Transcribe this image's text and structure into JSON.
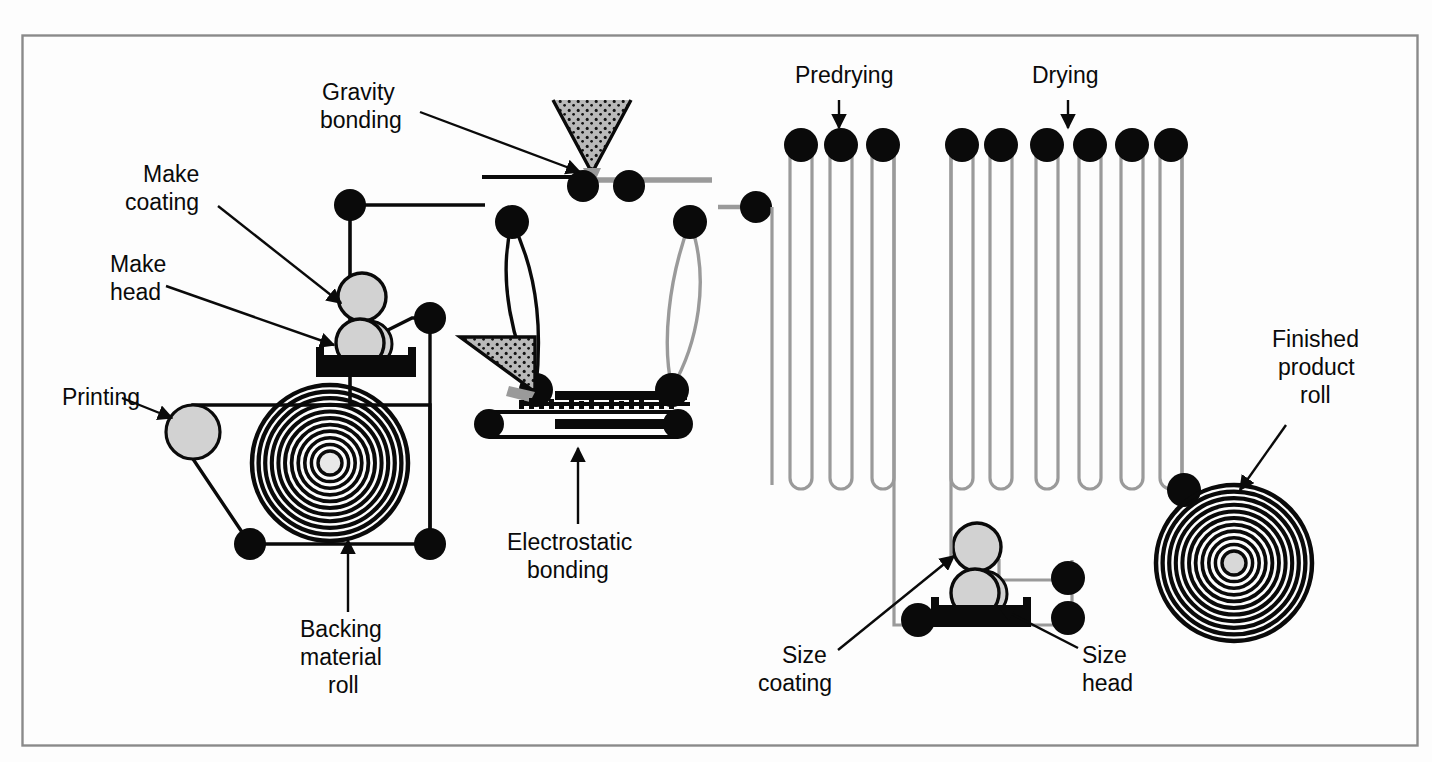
{
  "figure": {
    "background_color": "#fdfdfd",
    "border_color": "#8a8a8a",
    "ink_color": "#0a0a0a",
    "web_gray": "#9a9a9a",
    "roller_fill": "#d2d2d2",
    "grit_fill": "#b9b9b9"
  },
  "labels": {
    "printing": {
      "lines": [
        "Printing"
      ],
      "x": 62,
      "y": 405
    },
    "make_head": {
      "lines": [
        "Make",
        "head"
      ],
      "x": 110,
      "y": 272
    },
    "make_coating": {
      "lines": [
        "Make",
        "coating"
      ],
      "x": 143,
      "y": 182
    },
    "gravity_bonding": {
      "lines": [
        "Gravity",
        "bonding"
      ],
      "x": 322,
      "y": 100
    },
    "predrying": {
      "lines": [
        "Predrying"
      ],
      "x": 795,
      "y": 83
    },
    "drying": {
      "lines": [
        "Drying"
      ],
      "x": 1032,
      "y": 83
    },
    "finished_product_roll": {
      "lines": [
        "Finished",
        "product",
        "roll"
      ],
      "x": 1272,
      "y": 347
    },
    "backing_material_roll": {
      "lines": [
        "Backing",
        "material",
        "roll"
      ],
      "x": 300,
      "y": 637
    },
    "electrostatic_bonding": {
      "lines": [
        "Electrostatic",
        "bonding"
      ],
      "x": 527,
      "y": 550
    },
    "size_coating": {
      "lines": [
        "Size",
        "coating"
      ],
      "x": 782,
      "y": 663
    },
    "size_head": {
      "lines": [
        "Size",
        "head"
      ],
      "x": 1082,
      "y": 663
    }
  },
  "components": {
    "backing_material_roll": {
      "cx": 330,
      "cy": 463,
      "outer_r": 78,
      "turns": 11
    },
    "finished_product_roll": {
      "cx": 1234,
      "cy": 563,
      "outer_r": 78,
      "turns": 11
    },
    "printing_roller": {
      "cx": 193,
      "cy": 432,
      "r": 27
    },
    "make_coating_roller": {
      "cx": 362,
      "cy": 297,
      "r": 24
    },
    "make_head_roller": {
      "cx": 362,
      "cy": 343,
      "r": 24
    },
    "size_coating_roller": {
      "cx": 977,
      "cy": 547,
      "r": 24
    },
    "size_head_roller": {
      "cx": 977,
      "cy": 593,
      "r": 24
    },
    "gravity_hopper": {
      "apex_x": 592,
      "apex_y": 175,
      "top_y": 100,
      "half_w": 39
    },
    "electrostatic_hopper": {
      "apex_x": 499,
      "apex_y": 400,
      "top_y": 337
    },
    "predrying_rollers": [
      800,
      839,
      882
    ],
    "drying_rollers": [
      962,
      1000,
      1046,
      1089,
      1131,
      1170
    ],
    "predrying_label_target_x": 839,
    "drying_label_target_x": 1068
  }
}
